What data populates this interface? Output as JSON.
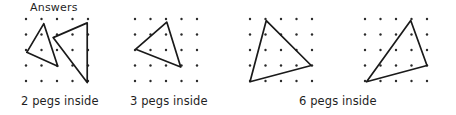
{
  "page": {
    "title": "Answers",
    "background_color": "#ffffff",
    "ink_color": "#1a1a1a",
    "width": 456,
    "height": 115
  },
  "heading": {
    "text": "Answers"
  },
  "boards": [
    {
      "id": "board-1",
      "grid": {
        "cols": 5,
        "rows": 5,
        "spacing": 15.5,
        "dot_radius": 1.2
      },
      "shapes": [
        {
          "name": "triangle-left",
          "vertices": [
            [
              1.15,
              0.3
            ],
            [
              0.05,
              2.15
            ],
            [
              2.05,
              3.05
            ]
          ]
        },
        {
          "name": "triangle-right",
          "vertices": [
            [
              3.95,
              0.25
            ],
            [
              1.75,
              1.2
            ],
            [
              3.95,
              4.1
            ]
          ]
        }
      ],
      "caption": "2 pegs inside",
      "pegs_inside": 2
    },
    {
      "id": "board-2",
      "grid": {
        "cols": 5,
        "rows": 5,
        "spacing": 15.5,
        "dot_radius": 1.2
      },
      "shapes": [
        {
          "name": "triangle",
          "vertices": [
            [
              2.05,
              0.2
            ],
            [
              0.05,
              1.95
            ],
            [
              2.95,
              3.1
            ]
          ]
        }
      ],
      "caption": "3 pegs inside",
      "pegs_inside": 3
    },
    {
      "id": "board-3",
      "grid": {
        "cols": 5,
        "rows": 5,
        "spacing": 15.5,
        "dot_radius": 1.2
      },
      "shapes": [
        {
          "name": "triangle",
          "vertices": [
            [
              1.05,
              0.1
            ],
            [
              0.0,
              4.05
            ],
            [
              3.95,
              3.0
            ]
          ]
        }
      ],
      "caption": "6 pegs inside",
      "pegs_inside": 6
    },
    {
      "id": "board-4",
      "grid": {
        "cols": 5,
        "rows": 5,
        "spacing": 15.5,
        "dot_radius": 1.2
      },
      "shapes": [
        {
          "name": "triangle",
          "vertices": [
            [
              2.95,
              0.1
            ],
            [
              0.1,
              4.05
            ],
            [
              4.0,
              3.0
            ]
          ]
        }
      ],
      "caption": "",
      "pegs_inside": 6
    }
  ],
  "captions": [
    {
      "id": "caption-1",
      "text": "2 pegs inside"
    },
    {
      "id": "caption-2",
      "text": "3 pegs inside"
    },
    {
      "id": "caption-3",
      "text": "6 pegs inside"
    }
  ]
}
